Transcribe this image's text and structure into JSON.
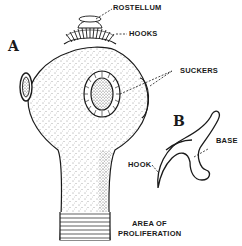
{
  "figure": {
    "panels": {
      "a": "A",
      "b": "B"
    },
    "labels": {
      "rostellum": "ROSTELLUM",
      "hooks": "HOOKS",
      "suckers": "SUCKERS",
      "hook": "HOOK",
      "base": "BASE",
      "area_line1": "AREA OF",
      "area_line2": "PROLIFERATION"
    },
    "colors": {
      "ink": "#1a1a1a",
      "background": "#ffffff"
    }
  }
}
